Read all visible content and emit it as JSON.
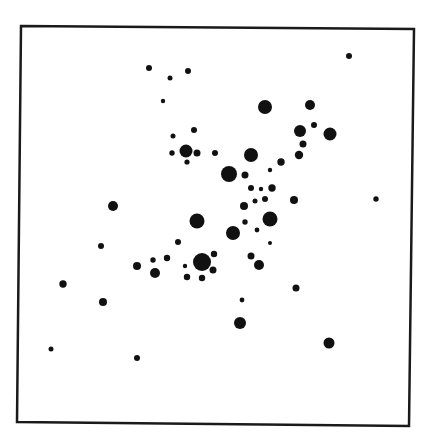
{
  "figure": {
    "frame": {
      "points": [
        [
          21,
          26
        ],
        [
          414,
          29
        ],
        [
          409,
          426
        ],
        [
          17,
          422
        ]
      ],
      "stroke": "#1a1a1a",
      "stroke_width": 2.5
    },
    "dot_color": "#111111",
    "background": "#ffffff",
    "dots": [
      {
        "x": 149,
        "y": 68,
        "r": 3
      },
      {
        "x": 170,
        "y": 78,
        "r": 2.5
      },
      {
        "x": 188,
        "y": 71,
        "r": 3
      },
      {
        "x": 163,
        "y": 101,
        "r": 2.2
      },
      {
        "x": 349,
        "y": 56,
        "r": 3
      },
      {
        "x": 265,
        "y": 107,
        "r": 7
      },
      {
        "x": 310,
        "y": 105,
        "r": 5
      },
      {
        "x": 300,
        "y": 131,
        "r": 6
      },
      {
        "x": 314,
        "y": 125,
        "r": 3
      },
      {
        "x": 330,
        "y": 134,
        "r": 6.5
      },
      {
        "x": 303,
        "y": 144,
        "r": 3.5
      },
      {
        "x": 299,
        "y": 155,
        "r": 4.2
      },
      {
        "x": 173,
        "y": 136,
        "r": 2.5
      },
      {
        "x": 194,
        "y": 130,
        "r": 3
      },
      {
        "x": 186,
        "y": 151,
        "r": 6.5
      },
      {
        "x": 172,
        "y": 153,
        "r": 2.7
      },
      {
        "x": 197,
        "y": 153,
        "r": 3.5
      },
      {
        "x": 187,
        "y": 162,
        "r": 2.6
      },
      {
        "x": 215,
        "y": 153,
        "r": 3
      },
      {
        "x": 251,
        "y": 155,
        "r": 7
      },
      {
        "x": 281,
        "y": 162,
        "r": 3.7
      },
      {
        "x": 270,
        "y": 170,
        "r": 2.2
      },
      {
        "x": 229,
        "y": 174,
        "r": 8
      },
      {
        "x": 245,
        "y": 175,
        "r": 3.5
      },
      {
        "x": 251,
        "y": 188,
        "r": 3
      },
      {
        "x": 261,
        "y": 189,
        "r": 2.2
      },
      {
        "x": 272,
        "y": 188,
        "r": 3.7
      },
      {
        "x": 255,
        "y": 201,
        "r": 2.5
      },
      {
        "x": 265,
        "y": 199,
        "r": 3
      },
      {
        "x": 294,
        "y": 200,
        "r": 4
      },
      {
        "x": 244,
        "y": 206,
        "r": 4
      },
      {
        "x": 270,
        "y": 219,
        "r": 7.5
      },
      {
        "x": 245,
        "y": 222,
        "r": 2.7
      },
      {
        "x": 257,
        "y": 230,
        "r": 2.4
      },
      {
        "x": 376,
        "y": 199,
        "r": 2.7
      },
      {
        "x": 113,
        "y": 206,
        "r": 5
      },
      {
        "x": 197,
        "y": 221,
        "r": 7.5
      },
      {
        "x": 233,
        "y": 233,
        "r": 7
      },
      {
        "x": 270,
        "y": 243,
        "r": 2
      },
      {
        "x": 101,
        "y": 246,
        "r": 3
      },
      {
        "x": 178,
        "y": 242,
        "r": 3
      },
      {
        "x": 153,
        "y": 260,
        "r": 2.7
      },
      {
        "x": 167,
        "y": 258,
        "r": 3.2
      },
      {
        "x": 251,
        "y": 256,
        "r": 3.5
      },
      {
        "x": 259,
        "y": 265,
        "r": 5
      },
      {
        "x": 137,
        "y": 266,
        "r": 4
      },
      {
        "x": 155,
        "y": 273,
        "r": 5
      },
      {
        "x": 202,
        "y": 262,
        "r": 9
      },
      {
        "x": 185,
        "y": 266,
        "r": 2.2
      },
      {
        "x": 214,
        "y": 254,
        "r": 3.2
      },
      {
        "x": 213,
        "y": 270,
        "r": 3.5
      },
      {
        "x": 187,
        "y": 277,
        "r": 3.2
      },
      {
        "x": 202,
        "y": 278,
        "r": 3.2
      },
      {
        "x": 63,
        "y": 284,
        "r": 3.7
      },
      {
        "x": 296,
        "y": 288,
        "r": 3.5
      },
      {
        "x": 103,
        "y": 302,
        "r": 4
      },
      {
        "x": 242,
        "y": 300,
        "r": 2.4
      },
      {
        "x": 240,
        "y": 323,
        "r": 6
      },
      {
        "x": 329,
        "y": 343,
        "r": 5.5
      },
      {
        "x": 51,
        "y": 349,
        "r": 2.5
      },
      {
        "x": 137,
        "y": 358,
        "r": 3
      }
    ]
  }
}
